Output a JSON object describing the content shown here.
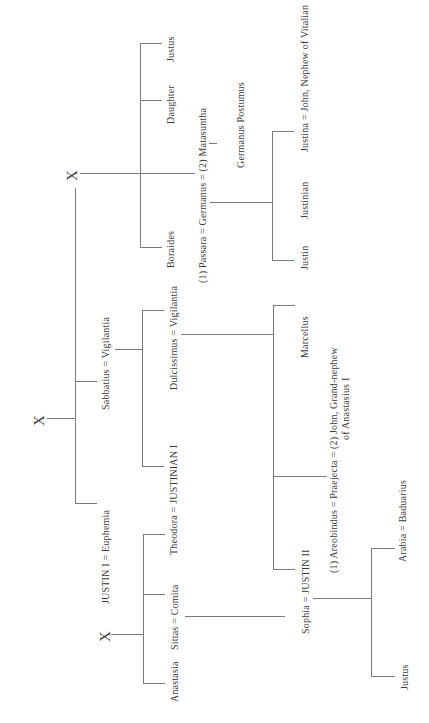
{
  "diagram": {
    "type": "genealogical-tree",
    "orientation": "rotated-90-ccw",
    "unknown_marker": "X",
    "nodes": {
      "x_top": "X",
      "x_middle": "X",
      "x_bottom": "X",
      "justus_top": "Justus",
      "daughter": "Daughter",
      "boraides": "Boraides",
      "germanus_marriage": "(1) Passara = Germanus = (2) Matasuntha",
      "germanus_postumus": "Germanus Postumus",
      "justina_marriage": "Justina = John, Nephew of Vitalian",
      "justinian_son": "Justinian",
      "justin_son": "Justin",
      "sabbatius_marriage": "Sabbatius = Vigilantia",
      "dulcissimus_marriage": "Dulcissimus = Vigilantia",
      "marcellus": "Marcellus",
      "praejecta_marriage_l1": "(1) Areobindus = Praejecta = (2) John, Grand-nephew",
      "praejecta_marriage_l2": "of Anastasius I",
      "justin1_marriage": "JUSTIN I = Euphemia",
      "theodora_marriage": "Theodora = JUSTINIAN I",
      "sophia_marriage": "Sophia = JUSTIN II",
      "arabia_marriage": "Arabia = Baduarius",
      "justus_bottom": "Justus",
      "sittas_marriage": "Sittas = Comita",
      "anastasia": "Anastasia"
    }
  }
}
